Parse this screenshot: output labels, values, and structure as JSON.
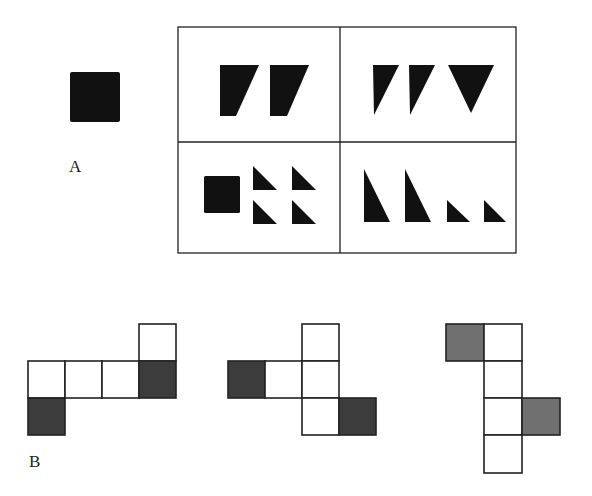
{
  "colors": {
    "shape_fill": "#111111",
    "shaded_face": "#4a4a4a",
    "line": "#222222",
    "background": "#ffffff"
  },
  "part_a": {
    "label": "A",
    "reference_shape": "filled-square",
    "options_grid": {
      "rows": 2,
      "cols": 2,
      "cells": [
        {
          "position": "top-left",
          "content": "two filled trapezoids"
        },
        {
          "position": "top-right",
          "content": "two right triangles and one inverted triangle"
        },
        {
          "position": "bottom-left",
          "content": "one small square and four small right triangles"
        },
        {
          "position": "bottom-right",
          "content": "two tall right triangles and two small right triangles"
        }
      ]
    }
  },
  "part_b": {
    "label": "B",
    "nets": [
      {
        "name": "net-1",
        "cells": 6,
        "shaded": 2
      },
      {
        "name": "net-2",
        "cells": 6,
        "shaded": 2
      },
      {
        "name": "net-3",
        "cells": 6,
        "shaded": 2
      }
    ]
  }
}
